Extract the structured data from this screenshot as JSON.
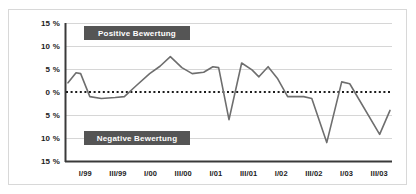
{
  "chart_data": {
    "type": "line",
    "title": "",
    "subtitle": "",
    "xlabel": "",
    "ylabel": "",
    "ylim": [
      -15,
      15
    ],
    "grid": true,
    "legend_position": "inline-banners",
    "ytick_labels": [
      "15 %",
      "10 %",
      "5 %",
      "0 %",
      "5 %",
      "10 %",
      "15 %"
    ],
    "ytick_values": [
      15,
      10,
      5,
      0,
      -5,
      -10,
      -15
    ],
    "xtick_labels": [
      "I/99",
      "III/99",
      "I/00",
      "III/00",
      "I/01",
      "III/01",
      "I/02",
      "III/02",
      "I/03",
      "III/03"
    ],
    "zero_line_style": "dotted",
    "annotations": [
      {
        "name": "positive-region-banner",
        "text": "Positive Bewertung",
        "value_sign": "positive"
      },
      {
        "name": "negative-region-banner",
        "text": "Negative Bewertung",
        "value_sign": "negative"
      }
    ],
    "series": [
      {
        "name": "Bewertungssaldo",
        "color": "#6e6e6e",
        "x": [
          "I/99",
          "II/99",
          "III/99",
          "IV/99",
          "I/00",
          "II/00",
          "III/00",
          "IV/00",
          "I/01",
          "II/01",
          "III/01",
          "IV/01",
          "I/02",
          "II/02",
          "III/02",
          "IV/02",
          "I/03",
          "II/03",
          "III/03",
          "IV/03"
        ],
        "values": [
          2.0,
          4.0,
          -1.0,
          -1.2,
          -1.0,
          1.5,
          5.0,
          7.7,
          4.0,
          4.2,
          5.5,
          -6.0,
          6.3,
          3.3,
          5.5,
          -1.0,
          -1.0,
          -11.0,
          2.2,
          -1.0
        ]
      }
    ],
    "points": [
      {
        "x": 0.0,
        "y": 2.0
      },
      {
        "x": 0.35,
        "y": 4.2
      },
      {
        "x": 0.55,
        "y": 4.0
      },
      {
        "x": 0.95,
        "y": -1.0
      },
      {
        "x": 1.45,
        "y": -1.4
      },
      {
        "x": 2.05,
        "y": -1.2
      },
      {
        "x": 2.45,
        "y": -1.0
      },
      {
        "x": 2.95,
        "y": 1.3
      },
      {
        "x": 3.55,
        "y": 4.0
      },
      {
        "x": 4.0,
        "y": 5.6
      },
      {
        "x": 4.45,
        "y": 7.7
      },
      {
        "x": 4.95,
        "y": 5.3
      },
      {
        "x": 5.4,
        "y": 4.0
      },
      {
        "x": 5.9,
        "y": 4.3
      },
      {
        "x": 6.3,
        "y": 5.5
      },
      {
        "x": 6.55,
        "y": 5.3
      },
      {
        "x": 7.0,
        "y": -6.0
      },
      {
        "x": 7.55,
        "y": 6.3
      },
      {
        "x": 8.0,
        "y": 4.8
      },
      {
        "x": 8.3,
        "y": 3.3
      },
      {
        "x": 8.7,
        "y": 5.5
      },
      {
        "x": 9.1,
        "y": 3.0
      },
      {
        "x": 9.55,
        "y": -1.0
      },
      {
        "x": 10.25,
        "y": -1.0
      },
      {
        "x": 10.6,
        "y": -1.4
      },
      {
        "x": 11.25,
        "y": -11.0
      },
      {
        "x": 11.9,
        "y": 2.2
      },
      {
        "x": 12.25,
        "y": 1.8
      },
      {
        "x": 13.55,
        "y": -9.2
      },
      {
        "x": 14.0,
        "y": -4.0
      }
    ]
  }
}
